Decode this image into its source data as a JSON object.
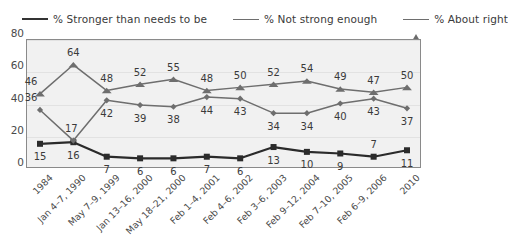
{
  "legend": {
    "items": [
      {
        "label": "% Stronger than needs to be",
        "marker": "square-marker-icon",
        "color": "#222222"
      },
      {
        "label": "% Not strong enough",
        "marker": "diamond-marker-icon",
        "color": "#6b6b6b"
      },
      {
        "label": "% About right",
        "marker": "triangle-marker-icon",
        "color": "#6b6b6b"
      }
    ]
  },
  "axis": {
    "yticks": [
      "0",
      "20",
      "40",
      "60",
      "80"
    ]
  },
  "chart_data": {
    "type": "line",
    "title": "",
    "xlabel": "",
    "ylabel": "",
    "ylim": [
      0,
      80
    ],
    "ytick_values": [
      0,
      20,
      40,
      60,
      80
    ],
    "grid": true,
    "legend_position": "top",
    "categories": [
      "1984",
      "Jan 4–7, 1990",
      "May 7–9, 1999",
      "Jan 13–16, 2000",
      "May 18–21, 2000",
      "Feb 1–4, 2001",
      "Feb 4–6, 2002",
      "Feb 3–6, 2003",
      "Feb 9–12, 2004",
      "Feb 7–10, 2005",
      "Feb 6–9, 2006",
      "2010"
    ],
    "series": [
      {
        "name": "% Stronger than needs to be",
        "values": [
          15,
          16,
          7,
          6,
          6,
          7,
          6,
          13,
          10,
          9,
          7,
          11
        ]
      },
      {
        "name": "% Not strong enough",
        "values": [
          36,
          17,
          42,
          39,
          38,
          44,
          43,
          34,
          34,
          40,
          43,
          37
        ]
      },
      {
        "name": "% About right",
        "values": [
          46,
          64,
          48,
          52,
          55,
          48,
          50,
          52,
          54,
          49,
          47,
          50
        ]
      }
    ]
  }
}
